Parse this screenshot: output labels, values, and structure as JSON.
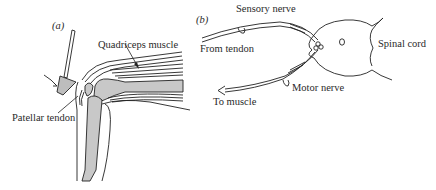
{
  "panels": [
    {
      "id": "a",
      "marker": "(a)",
      "labels": {
        "quadriceps": "Quadriceps muscle",
        "patellar_tendon": "Patellar tendon"
      }
    },
    {
      "id": "b",
      "marker": "(b)",
      "labels": {
        "sensory_nerve": "Sensory nerve",
        "from_tendon": "From tendon",
        "spinal_cord": "Spinal cord",
        "motor_nerve": "Motor nerve",
        "to_muscle": "To muscle"
      }
    }
  ],
  "colors": {
    "line": "#222222",
    "bone_fill": "#c8c8c8",
    "hammer_fill": "#bdbdbd",
    "background": "#ffffff"
  }
}
